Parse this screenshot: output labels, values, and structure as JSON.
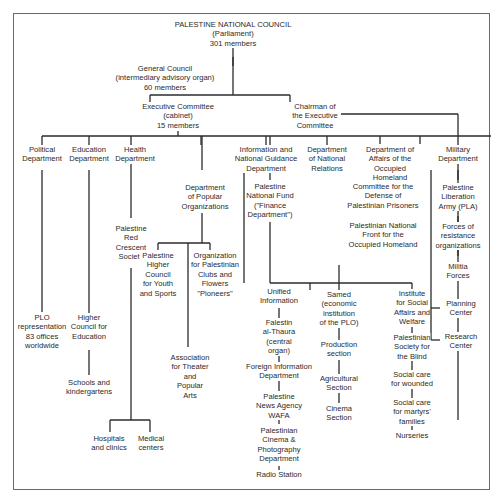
{
  "diagram": {
    "title": "PALESTINE NATIONAL COUNCIL (Parliament) 301 members",
    "nodes": {
      "pnc": "PALESTINE NATIONAL COUNCIL\n(Parliament)\n301 members",
      "general_council": "General Council\n(intermediary advisory organ)\n60 members",
      "executive_committee": "Executive Committee\n(cabinet)\n15 members",
      "chairman": "Chairman of\nthe Executive\nCommittee",
      "political_dept": "Political\nDepartment",
      "education_dept": "Education\nDepartment",
      "health_dept": "Health\nDepartment",
      "information_dept": "Information and\nNational Guidance\nDepartment",
      "national_relations": "Department\nof National\nRelations",
      "occupied_homeland": "Department of\nAffairs of the\nOccupied\nHomeland",
      "military_dept": "Military\nDepartment",
      "popular_orgs": "Department\nof Popular\nOrganizations",
      "national_fund": "Palestine\nNational Fund\n(\"Finance\nDepartment\")",
      "prisoners_committee": "Committee for the\nDefense of\nPalestinian Prisoners",
      "national_front": "Palestinian National\nFront for the\nOccupied Homeland",
      "pla": "Palestine\nLiberation\nArmy (PLA)",
      "resistance_forces": "Forces of\nresistance\norganizations",
      "militia": "Militia\nForces",
      "planning_center": "Planning\nCenter",
      "research_center": "Research\nCenter",
      "red_crescent": "Palestine\nRed\nCrescent\nSociety",
      "youth_council": "Palestine\nHigher\nCouncil\nfor Youth\nand Sports",
      "clubs_org": "Organization\nfor Palestinian\nClubs and\nFlowers\n\"Pioneers\"",
      "theater_assoc": "Association\nfor Theater\nand\nPopular\nArts",
      "plo_representation": "PLO\nrepresentation\n83 offices\nworldwide",
      "higher_council_edu": "Higher\nCouncil for\nEducation",
      "schools": "Schools and\nkindergartens",
      "hospitals": "Hospitals\nand clinics",
      "medical_centers": "Medical\ncenters",
      "unified_info": "Unified\nInformation",
      "falestin": "Falestin\nal-Thaura\n(central\norgan)",
      "foreign_info": "Foreign Information\nDepartment",
      "wafa": "Palestine\nNews Agency\nWAFA",
      "cinema_photo": "Palestinian\nCinema &\nPhotography\nDepartment",
      "radio": "Radio Station",
      "samed": "Samed\n(economic\ninstitution\nof the PLO)",
      "production": "Production\nsection",
      "agricultural": "Agricultural\nSection",
      "cinema_section": "Cinema\nSection",
      "social_institute": "Institute\nfor Social\nAffairs and\nWelfare",
      "blind_society": "Palestinian\nSociety for\nthe Blind",
      "wounded_care": "Social care\nfor wounded",
      "martyrs_care": "Social care\nfor martyrs'\nfamilies",
      "nurseries": "Nurseries"
    }
  }
}
